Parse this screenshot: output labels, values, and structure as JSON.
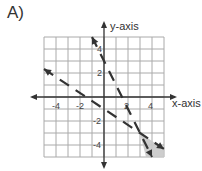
{
  "problem_label": "A)",
  "chart_data": {
    "type": "line",
    "title": "",
    "xlabel": "x-axis",
    "ylabel": "y-axis",
    "xlim": [
      -5,
      5
    ],
    "ylim": [
      -5,
      5
    ],
    "grid": true,
    "x_tick_labels": [
      "-4",
      "-2",
      "2",
      "4"
    ],
    "y_tick_labels": [
      "4",
      "2",
      "-2",
      "-4"
    ],
    "series": [
      {
        "name": "line-1",
        "equation": "y = -2x + 3",
        "style": "dashed",
        "x": [
          -1,
          4
        ],
        "y": [
          5,
          -5
        ]
      },
      {
        "name": "line-2",
        "equation": "y = -2/3x - 1",
        "style": "dashed",
        "x": [
          -5,
          5
        ],
        "y": [
          2.33,
          -4.33
        ]
      }
    ],
    "shaded_region": {
      "description": "region below both lines, lower right",
      "vertices": [
        [
          3,
          -3
        ],
        [
          5,
          -4.33
        ],
        [
          5,
          -5
        ],
        [
          3.5,
          -5
        ]
      ],
      "color": "#c8c8c8"
    },
    "intersection": [
      3,
      -3
    ]
  }
}
